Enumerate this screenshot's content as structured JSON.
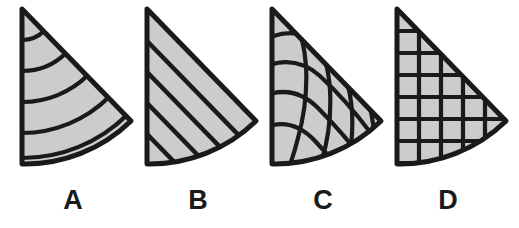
{
  "figure": {
    "background_color": "#ffffff",
    "fill_color": "#cccccc",
    "stroke_color": "#1a1a1a",
    "items": [
      {
        "label": "A",
        "pattern_name": "concentric-arcs",
        "pattern_description": "Quarter-sector divided by five concentric circular arcs centred on the apex, producing nested band shapes."
      },
      {
        "label": "B",
        "pattern_name": "parallel-diagonal-stripes",
        "pattern_description": "Quarter-sector divided by four straight lines parallel to the diagonal hypotenuse, producing tapering stripes."
      },
      {
        "label": "C",
        "pattern_name": "curvilinear-mesh",
        "pattern_description": "Quarter-sector filled with a warped curved grid of intersecting curved lines forming distorted quadrilaterals."
      },
      {
        "label": "D",
        "pattern_name": "square-grid",
        "pattern_description": "Quarter-sector filled with a regular orthogonal square grid clipped to the sector outline."
      }
    ]
  }
}
